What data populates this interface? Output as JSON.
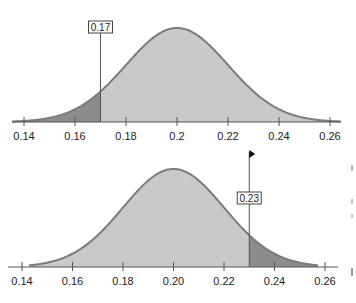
{
  "chart_data": [
    {
      "type": "area",
      "title": "",
      "description": "Normal distribution curve with left tail shaded at 0.17",
      "distribution": {
        "mean": 0.2,
        "sd": 0.02
      },
      "xlabel": "",
      "ylabel": "",
      "xlim": [
        0.135,
        0.265
      ],
      "ticks": [
        0.14,
        0.16,
        0.18,
        0.2,
        0.22,
        0.24,
        0.26
      ],
      "tick_labels": [
        "0.14",
        "0.16",
        "0.18",
        "0.2",
        "0.22",
        "0.24",
        "0.26"
      ],
      "marker": {
        "value": 0.17,
        "label": "0.17",
        "flag": false
      },
      "shaded_region": {
        "side": "left",
        "from": 0.135,
        "to": 0.17
      },
      "grid": false
    },
    {
      "type": "area",
      "title": "",
      "description": "Normal distribution curve with right tail shaded at 0.23",
      "distribution": {
        "mean": 0.2,
        "sd": 0.02
      },
      "xlabel": "",
      "ylabel": "",
      "xlim": [
        0.135,
        0.265
      ],
      "ticks": [
        0.14,
        0.16,
        0.18,
        0.2,
        0.22,
        0.24,
        0.26
      ],
      "tick_labels": [
        "0.14",
        "0.16",
        "0.18",
        "0.20",
        "0.22",
        "0.24",
        "0.26"
      ],
      "marker": {
        "value": 0.23,
        "label": "0.23",
        "flag": true
      },
      "shaded_region": {
        "side": "right",
        "from": 0.23,
        "to": 0.258
      },
      "grid": false
    }
  ],
  "colors": {
    "curve_fill": "#c9c9c9",
    "tail_fill": "#8c8c8c",
    "curve_stroke": "#7b7b7b",
    "axis": "#555555",
    "text": "#222222"
  }
}
